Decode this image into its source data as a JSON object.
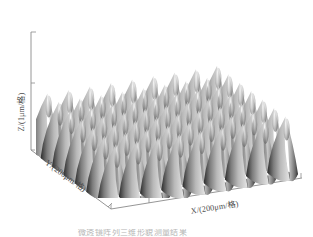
{
  "figure": {
    "kind": "3d-surface-plot",
    "background": "#ffffff",
    "axis_color": "#8a8a8a",
    "label_color": "#4a4a4a"
  },
  "axes": {
    "x": {
      "label": "X/(200μm/格)",
      "unit": "200μm/格",
      "ticks": 6
    },
    "y": {
      "label": "Y/(200μm/格)",
      "unit": "200μm/格",
      "ticks": 5
    },
    "z": {
      "label": "Z/(1μm/格)",
      "unit": "1μm/格",
      "ticks": 2
    }
  },
  "caption": {
    "text": "微透镜阵列三维形貌测量结果"
  },
  "chart_data": {
    "type": "surface",
    "title": "",
    "xlabel": "X/(200μm/格)",
    "ylabel": "Y/(200μm/格)",
    "zlabel": "Z/(1μm/格)",
    "grid": false,
    "legend": "none",
    "colormap": "grayscale",
    "colormap_low": "#1c1c1c",
    "colormap_high": "#f2f2f2",
    "nx": 9,
    "ny": 7,
    "period_x": 1.0,
    "period_y": 1.0,
    "peak_height": 1.0,
    "xlim": [
      0,
      9
    ],
    "ylim": [
      0,
      7
    ],
    "zlim": [
      0,
      1.2
    ],
    "surface_function": "z = A * |cos(pi*x) * cos(pi*y)|^1.6",
    "amplitude": 1.0
  }
}
